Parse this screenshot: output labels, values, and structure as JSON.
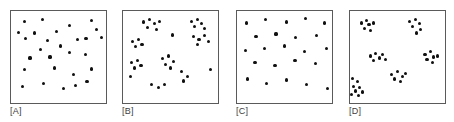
{
  "figure": {
    "panel_count": 4,
    "dot_color": "#101010",
    "frame_color": "#5a5a5a",
    "background_color": "#ffffff",
    "label_color": "#3d3d3d"
  },
  "panels": [
    {
      "id": "A",
      "label": "[A]",
      "pattern": "random",
      "point_count": 24,
      "frame": {
        "x": 10,
        "y": 10,
        "width": 97,
        "height": 94
      },
      "label_pos": {
        "x": 10,
        "y": 106
      }
    },
    {
      "id": "B",
      "label": "[B]",
      "pattern": "clustered",
      "point_count": 27,
      "frame": {
        "x": 122,
        "y": 10,
        "width": 97,
        "height": 94
      },
      "label_pos": {
        "x": 122,
        "y": 106
      }
    },
    {
      "id": "C",
      "label": "[C]",
      "pattern": "uniform",
      "point_count": 23,
      "frame": {
        "x": 236,
        "y": 10,
        "width": 97,
        "height": 94
      },
      "label_pos": {
        "x": 236,
        "y": 106
      }
    },
    {
      "id": "D",
      "label": "[D]",
      "pattern": "highly-clustered",
      "point_count": 38,
      "frame": {
        "x": 349,
        "y": 10,
        "width": 97,
        "height": 94
      },
      "label_pos": {
        "x": 349,
        "y": 106
      }
    }
  ],
  "chart_data": {
    "type": "scatter",
    "xlabel": "",
    "ylabel": "",
    "xlim": [
      0,
      100
    ],
    "ylim": [
      0,
      100
    ],
    "grid": false,
    "legend": "none",
    "note": "Coordinates are percentages of each panel's plot area; origin top-left.",
    "series": [
      {
        "name": "A",
        "pattern": "random",
        "points": [
          [
            14,
            11
          ],
          [
            33,
            9
          ],
          [
            62,
            16
          ],
          [
            85,
            10
          ],
          [
            8,
            23
          ],
          [
            25,
            24
          ],
          [
            48,
            22
          ],
          [
            90,
            20
          ],
          [
            15,
            30
          ],
          [
            38,
            32
          ],
          [
            70,
            31
          ],
          [
            79,
            30
          ],
          [
            95,
            29
          ],
          [
            31,
            42
          ],
          [
            52,
            38
          ],
          [
            62,
            45
          ],
          [
            20,
            51
          ],
          [
            41,
            50
          ],
          [
            78,
            47
          ],
          [
            14,
            64
          ],
          [
            46,
            62
          ],
          [
            66,
            69
          ],
          [
            85,
            63
          ],
          [
            12,
            82
          ],
          [
            34,
            79
          ],
          [
            55,
            84
          ],
          [
            68,
            81
          ],
          [
            80,
            77
          ]
        ]
      },
      {
        "name": "B",
        "pattern": "clustered",
        "points": [
          [
            22,
            12
          ],
          [
            28,
            9
          ],
          [
            33,
            14
          ],
          [
            26,
            18
          ],
          [
            35,
            20
          ],
          [
            38,
            11
          ],
          [
            72,
            11
          ],
          [
            78,
            9
          ],
          [
            83,
            14
          ],
          [
            75,
            17
          ],
          [
            86,
            19
          ],
          [
            52,
            26
          ],
          [
            74,
            28
          ],
          [
            80,
            31
          ],
          [
            86,
            27
          ],
          [
            90,
            33
          ],
          [
            78,
            36
          ],
          [
            10,
            33
          ],
          [
            16,
            31
          ],
          [
            20,
            36
          ],
          [
            13,
            39
          ],
          [
            9,
            56
          ],
          [
            15,
            54
          ],
          [
            19,
            59
          ],
          [
            12,
            62
          ],
          [
            42,
            52
          ],
          [
            48,
            49
          ],
          [
            53,
            55
          ],
          [
            45,
            58
          ],
          [
            50,
            62
          ],
          [
            62,
            66
          ],
          [
            68,
            71
          ],
          [
            64,
            76
          ],
          [
            92,
            64
          ],
          [
            8,
            71
          ],
          [
            30,
            80
          ],
          [
            37,
            83
          ],
          [
            44,
            80
          ]
        ]
      },
      {
        "name": "C",
        "pattern": "uniform",
        "points": [
          [
            10,
            13
          ],
          [
            30,
            9
          ],
          [
            52,
            12
          ],
          [
            72,
            8
          ],
          [
            92,
            13
          ],
          [
            20,
            28
          ],
          [
            41,
            25
          ],
          [
            62,
            29
          ],
          [
            84,
            27
          ],
          [
            9,
            43
          ],
          [
            29,
            41
          ],
          [
            50,
            38
          ],
          [
            71,
            44
          ],
          [
            94,
            41
          ],
          [
            19,
            56
          ],
          [
            40,
            59
          ],
          [
            61,
            54
          ],
          [
            83,
            57
          ],
          [
            11,
            74
          ],
          [
            31,
            79
          ],
          [
            52,
            75
          ],
          [
            73,
            80
          ],
          [
            95,
            84
          ]
        ]
      },
      {
        "name": "D",
        "pattern": "highly-clustered",
        "points": [
          [
            12,
            13
          ],
          [
            17,
            10
          ],
          [
            20,
            15
          ],
          [
            15,
            19
          ],
          [
            22,
            21
          ],
          [
            25,
            13
          ],
          [
            63,
            11
          ],
          [
            69,
            9
          ],
          [
            73,
            14
          ],
          [
            66,
            17
          ],
          [
            74,
            20
          ],
          [
            70,
            24
          ],
          [
            22,
            49
          ],
          [
            27,
            46
          ],
          [
            31,
            51
          ],
          [
            25,
            54
          ],
          [
            34,
            47
          ],
          [
            37,
            53
          ],
          [
            79,
            47
          ],
          [
            85,
            44
          ],
          [
            88,
            50
          ],
          [
            81,
            53
          ],
          [
            87,
            56
          ],
          [
            92,
            49
          ],
          [
            44,
            69
          ],
          [
            50,
            66
          ],
          [
            55,
            71
          ],
          [
            47,
            74
          ],
          [
            53,
            77
          ],
          [
            58,
            68
          ],
          [
            3,
            73
          ],
          [
            8,
            77
          ],
          [
            4,
            82
          ],
          [
            10,
            83
          ],
          [
            6,
            87
          ],
          [
            13,
            88
          ],
          [
            2,
            91
          ],
          [
            9,
            92
          ]
        ]
      }
    ]
  }
}
